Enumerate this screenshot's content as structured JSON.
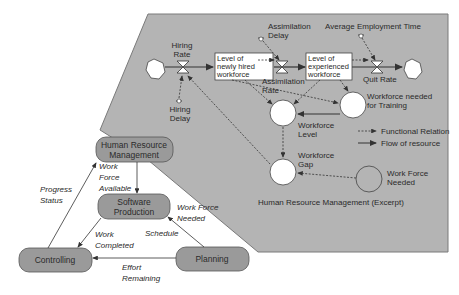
{
  "colors": {
    "panel_fill": "#b4b4b4",
    "panel_stroke": "#7a7a7a",
    "node_fill": "#9a9a9a",
    "node_stroke": "#555555",
    "white": "#ffffff",
    "line": "#444444",
    "background": "#ffffff"
  },
  "panel": {
    "title": "Human Resource Management (Excerpt)"
  },
  "stock_flow": {
    "hiring_rate": [
      "Hiring",
      "Rate"
    ],
    "hiring_delay": [
      "Hiring",
      "Delay"
    ],
    "level_new": [
      "Level of",
      "newly hired",
      "workforce"
    ],
    "assimilation_delay": [
      "Assimilation",
      "Delay"
    ],
    "assimilation_rate": [
      "Assimilation",
      "Rate"
    ],
    "level_exp": [
      "Level of",
      "experienced",
      "workforce"
    ],
    "avg_employment_time": "Average Employment Time",
    "quit_rate": "Quit Rate",
    "workforce_training": [
      "Workforce needed",
      "for Training"
    ],
    "workforce_level": [
      "Workforce",
      "Level"
    ],
    "workforce_gap": [
      "Workforce",
      "Gap"
    ],
    "work_force_needed": [
      "Work Force",
      "Needed"
    ]
  },
  "legend": {
    "functional": "Functional Relation",
    "flow": "Flow of resource"
  },
  "process_nodes": {
    "hrm": [
      "Human Resource",
      "Management"
    ],
    "software": [
      "Software",
      "Production"
    ],
    "controlling": "Controlling",
    "planning": "Planning"
  },
  "edge_labels": {
    "work_force_available": [
      "Work",
      "Force",
      "Available"
    ],
    "progress_status": [
      "Progress",
      "Status"
    ],
    "work_force_needed": [
      "Work Force",
      "Needed"
    ],
    "schedule": "Schedule",
    "work_completed": [
      "Work",
      "Completed"
    ],
    "effort_remaining": [
      "Effort",
      "Remaining"
    ]
  }
}
